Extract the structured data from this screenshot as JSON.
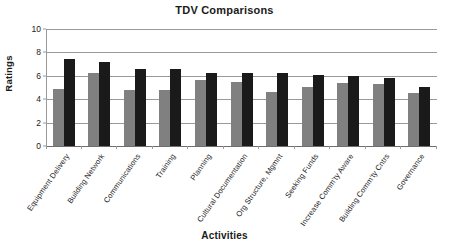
{
  "chart_data": {
    "type": "bar",
    "title": "TDV Comparisons",
    "xlabel": "Activities",
    "ylabel": "Ratings",
    "ylim": [
      0,
      10
    ],
    "yticks": [
      0,
      2,
      4,
      6,
      8,
      10
    ],
    "grid": true,
    "legend": "none",
    "categories": [
      "Equipment Delivery",
      "Building Network",
      "Communications",
      "Training",
      "Planning",
      "Cultural Documentation",
      "Org Structure, Mgmnt",
      "Seeking Funds",
      "Increase Comm'ty Aware",
      "Building Comm'ty Cntrs",
      "Governance"
    ],
    "series": [
      {
        "name": "series-1",
        "color": "#808080",
        "values": [
          4.9,
          6.25,
          4.8,
          4.8,
          5.65,
          5.45,
          4.65,
          5.05,
          5.4,
          5.3,
          4.55
        ]
      },
      {
        "name": "series-2",
        "color": "#1a1a1a",
        "values": [
          7.4,
          7.15,
          6.6,
          6.55,
          6.25,
          6.25,
          6.2,
          6.05,
          5.95,
          5.85,
          5.05
        ]
      }
    ]
  }
}
